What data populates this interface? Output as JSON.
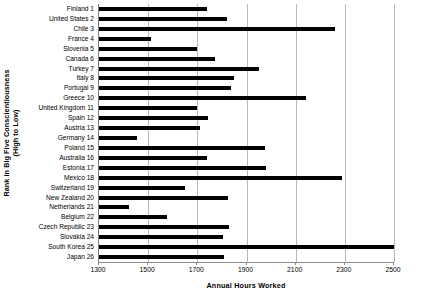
{
  "chart_data": {
    "type": "bar",
    "orientation": "horizontal",
    "title": "",
    "xlabel": "Annual Hours Worked",
    "ylabel": "Rank in Big Five Conscientiousness\n(High to Low)",
    "ylabel_line1": "Rank in Big Five Conscientiousness",
    "ylabel_line2": "(High to Low)",
    "xlim": [
      1300,
      2500
    ],
    "xticks": [
      1300,
      1500,
      1700,
      1900,
      2100,
      2300,
      2500
    ],
    "xtick_labels": [
      "1300",
      "1500",
      "1700",
      "1900",
      "2100",
      "2300",
      "2500"
    ],
    "grid": "vertical",
    "legend": "none",
    "bar_color": "#000000",
    "categories": [
      "Finland 1",
      "United States 2",
      "Chile 3",
      "France 4",
      "Slovenia 5",
      "Canada 6",
      "Turkey 7",
      "Italy 8",
      "Portugal 9",
      "Greece 10",
      "United Kingdom 11",
      "Spain 12",
      "Austria 13",
      "Germany 14",
      "Poland 15",
      "Australia 16",
      "Estonia 17",
      "Mexico 18",
      "Switzerland 19",
      "New Zealand 20",
      "Netherlands 21",
      "Belgium 22",
      "Czech Republic 23",
      "Slovakia 24",
      "South Korea 25",
      "Japan 26"
    ],
    "values": [
      1740,
      1820,
      2260,
      1510,
      1700,
      1770,
      1950,
      1850,
      1835,
      2140,
      1700,
      1745,
      1710,
      1455,
      1975,
      1740,
      1980,
      2290,
      1650,
      1825,
      1420,
      1575,
      1830,
      1805,
      2500,
      1810
    ]
  }
}
